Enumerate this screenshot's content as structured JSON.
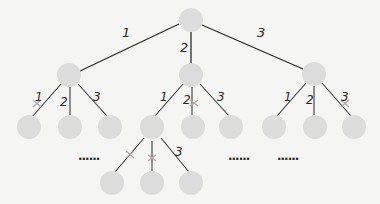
{
  "diagram": {
    "type": "search-tree",
    "colors": {
      "background": "#f5f5f3",
      "node": "#dcdcdc",
      "edge": "#2a2a2a",
      "cross": "#b8a8ac"
    },
    "root_edges": {
      "left": "1",
      "middle": "2",
      "right": "3"
    },
    "subtrees": {
      "left": {
        "edges": [
          "1",
          "2",
          "3"
        ],
        "pruned": [
          "1"
        ]
      },
      "middle": {
        "edges": [
          "1",
          "2",
          "3"
        ],
        "pruned": [
          "2"
        ]
      },
      "right": {
        "edges": [
          "1",
          "2",
          "3"
        ],
        "pruned": [
          "3"
        ]
      }
    },
    "deep_subtree": {
      "parent": "middle-1",
      "edges": [
        "",
        "",
        "3"
      ],
      "pruned": [
        "1",
        "2"
      ]
    },
    "ellipses": [
      "......",
      "......",
      "......"
    ]
  }
}
